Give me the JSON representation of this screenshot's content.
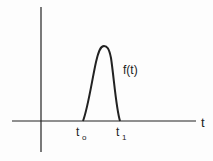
{
  "diagram": {
    "type": "pulse-function-plot",
    "curve_label": "f(t)",
    "x_axis_label": "t",
    "start_label": {
      "base": "t",
      "sub": "o"
    },
    "end_label": {
      "base": "t",
      "sub": "1"
    }
  },
  "colors": {
    "stroke": "#222222",
    "background": "#fdfdfd"
  }
}
